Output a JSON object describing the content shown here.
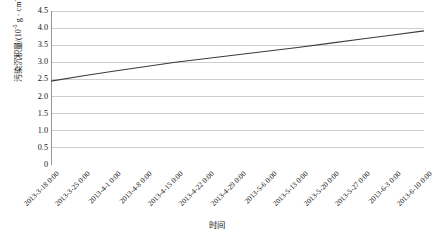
{
  "chart_data": {
    "type": "line",
    "title": "",
    "xlabel": "时间",
    "ylabel": "污染沉积量/(10⁻⁵ g · cm⁻²)",
    "ylabel_parts": {
      "prefix": "污染沉积量/(10",
      "exponent1": "-5",
      "middle": " g · cm",
      "exponent2": "-2",
      "suffix": ")"
    },
    "ylim": [
      0,
      4.5
    ],
    "ytick_step": 0.5,
    "yticks": [
      "0",
      "0.5",
      "1.0",
      "1.5",
      "2.0",
      "2.5",
      "3.0",
      "3.5",
      "4.0",
      "4.5"
    ],
    "ytick_values": [
      0,
      0.5,
      1.0,
      1.5,
      2.0,
      2.5,
      3.0,
      3.5,
      4.0,
      4.5
    ],
    "grid": true,
    "grid_axis": "y",
    "legend": false,
    "legend_position": "none",
    "categories": [
      "2013-3-18 0:00",
      "2013-3-25 0:00",
      "2013-4-1 0:00",
      "2013-4-8 0:00",
      "2013-4-15 0:00",
      "2013-4-22 0:00",
      "2013-4-29 0:00",
      "2013-5-6 0:00",
      "2013-5-13 0:00",
      "2013-5-20 0:00",
      "2013-5-27 0:00",
      "2013-6-3 0:00",
      "2013-6-10 0:00"
    ],
    "values": [
      2.45,
      2.6,
      2.74,
      2.87,
      3.0,
      3.11,
      3.22,
      3.33,
      3.44,
      3.56,
      3.68,
      3.8,
      3.92
    ],
    "series": [
      {
        "name": "污染沉积量",
        "color": "#3a3a3a",
        "values": [
          2.45,
          2.6,
          2.74,
          2.87,
          3.0,
          3.11,
          3.22,
          3.33,
          3.44,
          3.56,
          3.68,
          3.8,
          3.92
        ]
      }
    ],
    "colors": {
      "line": "#3a3a3a",
      "grid": "#b9b9b9",
      "axis": "#8a8a8a",
      "text": "#141414",
      "background": "#ffffff"
    }
  }
}
